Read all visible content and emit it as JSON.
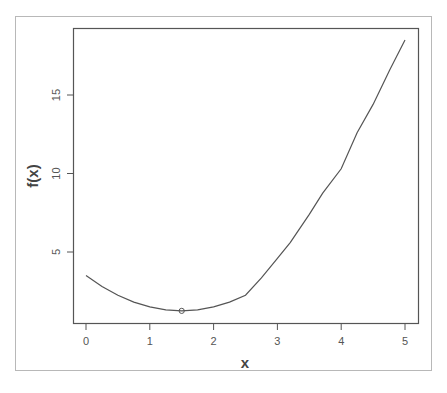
{
  "chart_data": {
    "type": "line",
    "title": "",
    "xlabel": "x",
    "ylabel": "f(x)",
    "xlim": [
      0,
      5
    ],
    "ylim": [
      1,
      18.6
    ],
    "grid": false,
    "legend": null,
    "x_ticks": [
      0,
      1,
      2,
      3,
      4,
      5
    ],
    "x_tick_labels": [
      "0",
      "1",
      "2",
      "3",
      "4",
      "5"
    ],
    "y_ticks": [
      5,
      10,
      15
    ],
    "y_tick_labels": [
      "5",
      "10",
      "15"
    ],
    "series": [
      {
        "name": "f(x)",
        "x": [
          0,
          0.25,
          0.5,
          0.75,
          1.0,
          1.25,
          1.5,
          1.75,
          2.0,
          2.25,
          2.5,
          2.75,
          3.0,
          3.2,
          3.5,
          3.71,
          4.0,
          4.25,
          4.5,
          4.76,
          5.0
        ],
        "y": [
          3.5,
          2.81,
          2.25,
          1.81,
          1.5,
          1.31,
          1.25,
          1.31,
          1.5,
          1.81,
          2.25,
          3.35,
          4.6,
          5.6,
          7.4,
          8.75,
          10.3,
          12.6,
          14.4,
          16.6,
          18.5
        ]
      }
    ],
    "annotations": [
      {
        "type": "point-marker",
        "shape": "open-circle",
        "x": 1.5,
        "y": 1.25,
        "label": "minimum"
      }
    ]
  },
  "labels": {
    "xlabel": "x",
    "ylabel": "f(x)"
  }
}
